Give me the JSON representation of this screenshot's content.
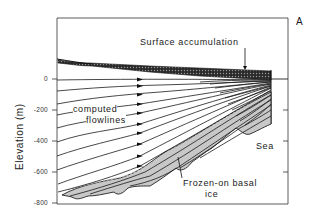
{
  "figure": {
    "panel_label": "A",
    "y_axis": {
      "label": "Elevation (m)",
      "ticks": [
        "0",
        "-200",
        "-400",
        "-600",
        "-800"
      ]
    },
    "annotations": {
      "surface_accumulation": "Surface accumulation",
      "computed_flowlines_line1": "computed",
      "computed_flowlines_line2": "flowlines",
      "sea": "Sea",
      "frozen_on_line1": "Frozen-on basal",
      "frozen_on_line2": "ice"
    },
    "colors": {
      "line": "#1a1a1a",
      "basal_ice_fill": "#c8c8c8",
      "accumulation_fill": "#2a2a2a",
      "background": "#ffffff"
    }
  }
}
